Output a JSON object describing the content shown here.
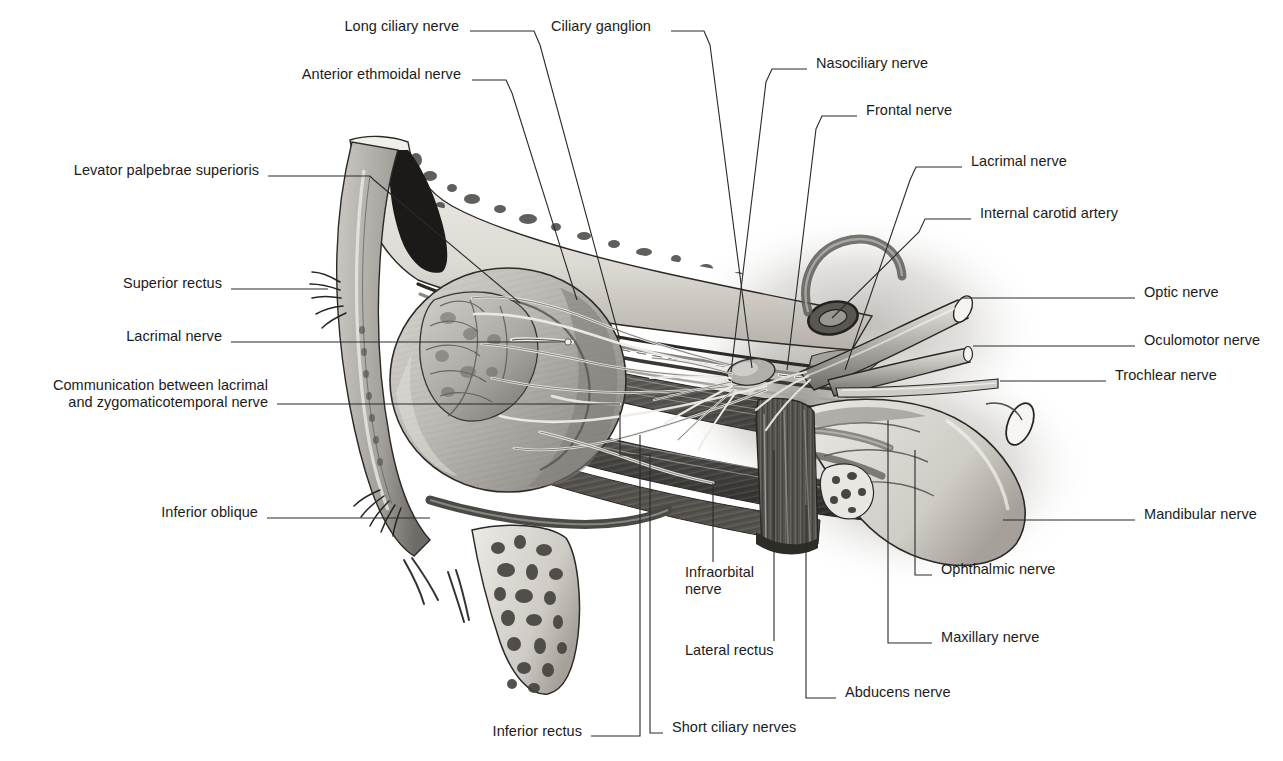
{
  "figure": {
    "background_color": "#ffffff",
    "text_color": "#1b1b1b",
    "leader_color": "#2a2a2a",
    "width": 1283,
    "height": 761
  },
  "labels": [
    {
      "id": "long-ciliary-nerve",
      "text": "Long ciliary nerve",
      "x": 459,
      "y": 26,
      "align": "r"
    },
    {
      "id": "ciliary-ganglion",
      "text": "Ciliary ganglion",
      "x": 551,
      "y": 26,
      "align": "l"
    },
    {
      "id": "nasociliary-nerve",
      "text": "Nasociliary nerve",
      "x": 816,
      "y": 63,
      "align": "l"
    },
    {
      "id": "frontal-nerve",
      "text": "Frontal nerve",
      "x": 866,
      "y": 110,
      "align": "l"
    },
    {
      "id": "anterior-ethmoidal-nerve",
      "text": "Anterior ethmoidal nerve",
      "x": 461,
      "y": 74,
      "align": "r"
    },
    {
      "id": "lacrimal-nerve-top",
      "text": "Lacrimal nerve",
      "x": 971,
      "y": 161,
      "align": "l"
    },
    {
      "id": "internal-carotid-artery",
      "text": "Internal carotid artery",
      "x": 980,
      "y": 213,
      "align": "l"
    },
    {
      "id": "levator-palpebrae",
      "text": "Levator palpebrae superioris",
      "x": 259,
      "y": 170,
      "align": "r"
    },
    {
      "id": "superior-rectus",
      "text": "Superior rectus",
      "x": 222,
      "y": 283,
      "align": "r"
    },
    {
      "id": "lacrimal-nerve-left",
      "text": "Lacrimal nerve",
      "x": 222,
      "y": 336,
      "align": "r"
    },
    {
      "id": "communication-lacrimal-zygomaticotemporal",
      "text": "Communication between lacrimal\nand zygomaticotemporal nerve",
      "x": 268,
      "y": 385,
      "align": "r"
    },
    {
      "id": "inferior-oblique",
      "text": "Inferior oblique",
      "x": 258,
      "y": 512,
      "align": "r"
    },
    {
      "id": "optic-nerve",
      "text": "Optic nerve",
      "x": 1144,
      "y": 292,
      "align": "l"
    },
    {
      "id": "oculomotor-nerve",
      "text": "Oculomotor nerve",
      "x": 1144,
      "y": 340,
      "align": "l"
    },
    {
      "id": "trochlear-nerve",
      "text": "Trochlear nerve",
      "x": 1115,
      "y": 375,
      "align": "l"
    },
    {
      "id": "mandibular-nerve",
      "text": "Mandibular nerve",
      "x": 1144,
      "y": 514,
      "align": "l"
    },
    {
      "id": "ophthalmic-nerve",
      "text": "Ophthalmic nerve",
      "x": 941,
      "y": 569,
      "align": "l"
    },
    {
      "id": "maxillary-nerve",
      "text": "Maxillary nerve",
      "x": 941,
      "y": 637,
      "align": "l"
    },
    {
      "id": "abducens-nerve",
      "text": "Abducens nerve",
      "x": 845,
      "y": 692,
      "align": "l"
    },
    {
      "id": "infraorbital-nerve",
      "text": "Infraorbital\nnerve",
      "x": 685,
      "y": 572,
      "align": "l"
    },
    {
      "id": "lateral-rectus",
      "text": "Lateral rectus",
      "x": 685,
      "y": 650,
      "align": "l"
    },
    {
      "id": "inferior-rectus",
      "text": "Inferior rectus",
      "x": 582,
      "y": 731,
      "align": "r"
    },
    {
      "id": "short-ciliary-nerves",
      "text": "Short ciliary nerves",
      "x": 672,
      "y": 727,
      "align": "l"
    }
  ],
  "leaders": [
    {
      "id": "leader-long-ciliary-nerve",
      "points": "470,31 534,31 540,45 620,340"
    },
    {
      "id": "leader-ciliary-ganglion",
      "points": "671,31 704,31 710,45 752,368"
    },
    {
      "id": "leader-anterior-ethmoidal-nerve",
      "points": "472,80 506,80 512,93 577,300"
    },
    {
      "id": "leader-nasociliary-nerve",
      "points": "807,69 772,69 766,82 731,372"
    },
    {
      "id": "leader-frontal-nerve",
      "points": "857,116 822,116 816,129 787,370"
    },
    {
      "id": "leader-lacrimal-nerve-top",
      "points": "962,167 916,167 910,180 845,370"
    },
    {
      "id": "leader-internal-carotid-artery",
      "points": "971,219 925,219 919,232 832,318"
    },
    {
      "id": "leader-levator-palpebrae",
      "points": "268,176 370,176 374,180 520,303"
    },
    {
      "id": "leader-superior-rectus",
      "points": "231,289 328,289"
    },
    {
      "id": "leader-lacrimal-nerve-left",
      "points": "231,342 565,342"
    },
    {
      "id": "leader-communication",
      "points": "277,404 620,404"
    },
    {
      "id": "leader-inferior-oblique",
      "points": "267,518 430,518"
    },
    {
      "id": "leader-optic-nerve",
      "points": "1135,298 962,298"
    },
    {
      "id": "leader-oculomotor-nerve",
      "points": "1135,346 973,346"
    },
    {
      "id": "leader-trochlear-nerve",
      "points": "1106,381 1000,381"
    },
    {
      "id": "leader-mandibular-nerve",
      "points": "1135,520 1003,520"
    },
    {
      "id": "leader-ophthalmic-nerve",
      "points": "932,575 915,575 915,450"
    },
    {
      "id": "leader-maxillary-nerve",
      "points": "932,643 888,643 888,420"
    },
    {
      "id": "leader-abducens-nerve",
      "points": "836,698 806,698 806,505"
    },
    {
      "id": "leader-infraorbital-nerve",
      "points": "713,562 713,483"
    },
    {
      "id": "leader-lateral-rectus",
      "points": "774,641 774,450"
    },
    {
      "id": "leader-inferior-rectus",
      "points": "591,736 640,736 640,435"
    },
    {
      "id": "leader-short-ciliary-nerves",
      "points": "663,733 650,733 650,455 620,455 620,412"
    }
  ],
  "artwork": {
    "description": "Lateral dissection of the right orbit: eyeball with lacrimal gland, extraocular muscles, orbital roof and floor bone with trabeculae, frontal sinus, ciliary ganglion, trigeminal ganglion and cut nerve stumps.",
    "tones": {
      "bone_light": "#e8e6e2",
      "bone_mid": "#b9b5ae",
      "muscle_dark": "#4a4845",
      "muscle_mid": "#76736e",
      "globe_light": "#c9c6c1",
      "sinus_black": "#1c1b1a",
      "nerve_pale": "#d6d3ce",
      "outline": "#232220"
    }
  }
}
